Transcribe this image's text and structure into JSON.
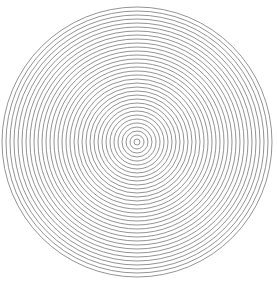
{
  "figure": {
    "type": "concentric-circles",
    "center": [
      137,
      142
    ],
    "inner_radius": 3,
    "ring_spacing": 4,
    "ring_count": 34,
    "stroke_color": "#888888",
    "background": "#ffffff"
  }
}
